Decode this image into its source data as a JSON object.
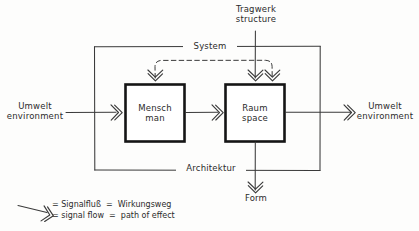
{
  "diagram": {
    "colors": {
      "ink": "#2b2b2b",
      "line": "#3a3a3a",
      "paper": "#fdfdfc",
      "box_border": "#151515"
    },
    "outer_box": {
      "top_label": "System",
      "bottom_label": "Architektur"
    },
    "nodes": [
      {
        "id": "mensch",
        "line_de": "Mensch",
        "line_en": "man"
      },
      {
        "id": "raum",
        "line_de": "Raum",
        "line_en": "space"
      }
    ],
    "external": {
      "left": {
        "line_de": "Umwelt",
        "line_en": "environment"
      },
      "right": {
        "line_de": "Umwelt",
        "line_en": "environment"
      },
      "top": {
        "line_de": "Tragwerk",
        "line_en": "structure"
      },
      "bottom": {
        "line_de": "Form",
        "line_en": ""
      }
    },
    "legend": {
      "symbol": "arrow-double-chevron",
      "line_de": "= Signalfluß  =  Wirkungsweg",
      "line_en": "= signal flow  =  path of effect"
    }
  }
}
